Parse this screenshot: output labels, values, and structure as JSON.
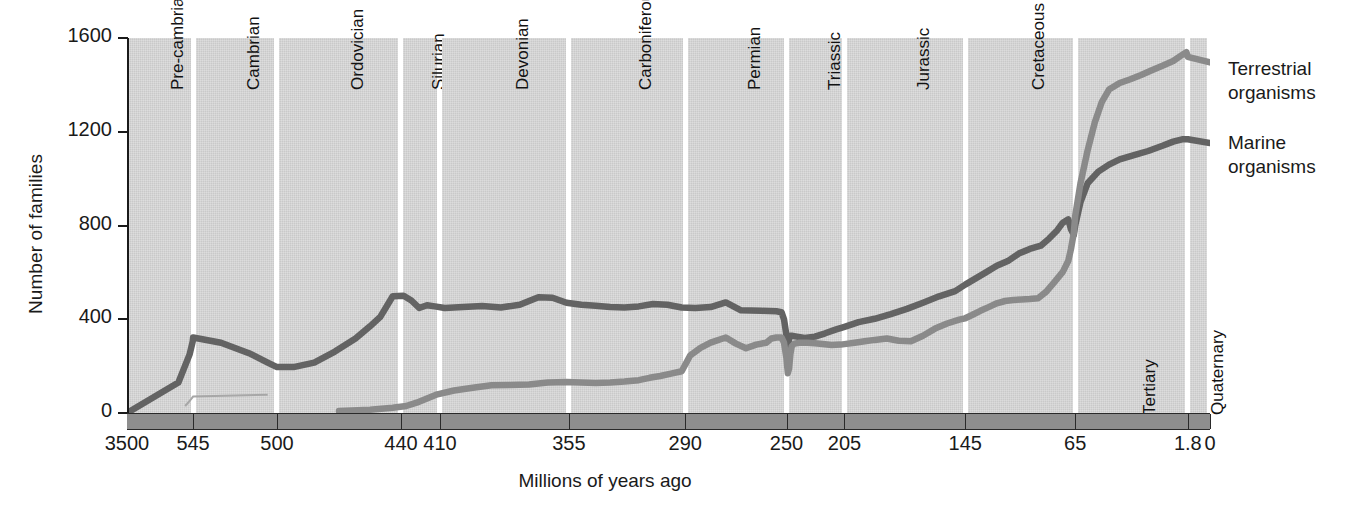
{
  "chart_data": {
    "type": "line",
    "title": "",
    "xlabel": "Millions of years ago",
    "ylabel": "Number of families",
    "ylim": [
      0,
      1600
    ],
    "yticks": [
      0,
      400,
      800,
      1200,
      1600
    ],
    "xticks": [
      "3500",
      "545",
      "500",
      "440",
      "410",
      "355",
      "290",
      "250",
      "205",
      "145",
      "65",
      "1.8",
      "0"
    ],
    "x_axis_direction": "reversed",
    "grid": false,
    "legend_position": "right",
    "background_band_color": "#c9c9c9",
    "periods": [
      {
        "name": "Pre-cambrian",
        "from": 3500,
        "to": 545
      },
      {
        "name": "Cambrian",
        "from": 545,
        "to": 500
      },
      {
        "name": "Ordovician",
        "from": 500,
        "to": 440
      },
      {
        "name": "Silurian",
        "from": 440,
        "to": 410
      },
      {
        "name": "Devonian",
        "from": 410,
        "to": 355
      },
      {
        "name": "Carboniferous",
        "from": 355,
        "to": 290
      },
      {
        "name": "Permian",
        "from": 290,
        "to": 250
      },
      {
        "name": "Triassic",
        "from": 250,
        "to": 205
      },
      {
        "name": "Jurassic",
        "from": 205,
        "to": 145
      },
      {
        "name": "Cretaceous",
        "from": 145,
        "to": 65
      },
      {
        "name": "Tertiary",
        "from": 65,
        "to": 1.8
      },
      {
        "name": "Quaternary",
        "from": 1.8,
        "to": 0
      }
    ],
    "series": [
      {
        "name": "Marine organisms",
        "color": "#636363",
        "label_line1": "Marine",
        "label_line2": "organisms",
        "points": [
          [
            3500,
            0
          ],
          [
            1200,
            130
          ],
          [
            700,
            250
          ],
          [
            560,
            305
          ],
          [
            545,
            322
          ],
          [
            530,
            300
          ],
          [
            515,
            255
          ],
          [
            505,
            215
          ],
          [
            500,
            196
          ],
          [
            492,
            196
          ],
          [
            482,
            215
          ],
          [
            472,
            262
          ],
          [
            462,
            318
          ],
          [
            455,
            370
          ],
          [
            450,
            410
          ],
          [
            444,
            498
          ],
          [
            438,
            500
          ],
          [
            432,
            480
          ],
          [
            426,
            448
          ],
          [
            420,
            460
          ],
          [
            414,
            455
          ],
          [
            408,
            448
          ],
          [
            400,
            452
          ],
          [
            392,
            456
          ],
          [
            384,
            450
          ],
          [
            376,
            462
          ],
          [
            368,
            494
          ],
          [
            362,
            492
          ],
          [
            356,
            470
          ],
          [
            348,
            462
          ],
          [
            340,
            458
          ],
          [
            332,
            452
          ],
          [
            324,
            450
          ],
          [
            316,
            455
          ],
          [
            308,
            465
          ],
          [
            300,
            462
          ],
          [
            292,
            450
          ],
          [
            286,
            448
          ],
          [
            280,
            452
          ],
          [
            274,
            472
          ],
          [
            268,
            438
          ],
          [
            260,
            436
          ],
          [
            254,
            434
          ],
          [
            252,
            430
          ],
          [
            251,
            400
          ],
          [
            250,
            330
          ],
          [
            249,
            278
          ],
          [
            248,
            318
          ],
          [
            247,
            330
          ],
          [
            246,
            330
          ],
          [
            242,
            326
          ],
          [
            236,
            320
          ],
          [
            228,
            326
          ],
          [
            220,
            340
          ],
          [
            212,
            356
          ],
          [
            205,
            368
          ],
          [
            198,
            388
          ],
          [
            190,
            402
          ],
          [
            182,
            422
          ],
          [
            174,
            444
          ],
          [
            166,
            470
          ],
          [
            158,
            498
          ],
          [
            150,
            520
          ],
          [
            145,
            548
          ],
          [
            138,
            572
          ],
          [
            130,
            600
          ],
          [
            122,
            628
          ],
          [
            114,
            648
          ],
          [
            106,
            680
          ],
          [
            98,
            700
          ],
          [
            90,
            714
          ],
          [
            84,
            744
          ],
          [
            78,
            780
          ],
          [
            74,
            812
          ],
          [
            70,
            826
          ],
          [
            68,
            784
          ],
          [
            66,
            760
          ],
          [
            65,
            800
          ],
          [
            62,
            900
          ],
          [
            58,
            980
          ],
          [
            52,
            1030
          ],
          [
            46,
            1060
          ],
          [
            40,
            1082
          ],
          [
            32,
            1100
          ],
          [
            24,
            1118
          ],
          [
            16,
            1140
          ],
          [
            10,
            1158
          ],
          [
            5,
            1168
          ],
          [
            1.8,
            1168
          ],
          [
            0,
            1152
          ]
        ]
      },
      {
        "name": "Terrestrial organisms",
        "color": "#8a8a8a",
        "label_line1": "Terrestrial",
        "label_line2": "organisms",
        "points": [
          [
            470,
            8
          ],
          [
            455,
            14
          ],
          [
            444,
            22
          ],
          [
            436,
            30
          ],
          [
            428,
            44
          ],
          [
            420,
            62
          ],
          [
            412,
            80
          ],
          [
            404,
            96
          ],
          [
            396,
            108
          ],
          [
            388,
            118
          ],
          [
            380,
            120
          ],
          [
            372,
            122
          ],
          [
            364,
            130
          ],
          [
            356,
            132
          ],
          [
            348,
            130
          ],
          [
            340,
            128
          ],
          [
            332,
            130
          ],
          [
            324,
            134
          ],
          [
            316,
            140
          ],
          [
            310,
            150
          ],
          [
            304,
            158
          ],
          [
            298,
            168
          ],
          [
            292,
            178
          ],
          [
            288,
            246
          ],
          [
            284,
            278
          ],
          [
            280,
            300
          ],
          [
            274,
            322
          ],
          [
            270,
            296
          ],
          [
            266,
            276
          ],
          [
            262,
            292
          ],
          [
            258,
            300
          ],
          [
            256,
            318
          ],
          [
            254,
            322
          ],
          [
            252,
            322
          ],
          [
            251,
            300
          ],
          [
            250,
            232
          ],
          [
            249,
            170
          ],
          [
            248,
            190
          ],
          [
            247,
            252
          ],
          [
            246,
            284
          ],
          [
            244,
            296
          ],
          [
            240,
            300
          ],
          [
            234,
            300
          ],
          [
            228,
            298
          ],
          [
            222,
            294
          ],
          [
            215,
            290
          ],
          [
            208,
            292
          ],
          [
            205,
            294
          ],
          [
            200,
            300
          ],
          [
            195,
            306
          ],
          [
            190,
            312
          ],
          [
            184,
            318
          ],
          [
            178,
            308
          ],
          [
            172,
            306
          ],
          [
            166,
            330
          ],
          [
            160,
            360
          ],
          [
            154,
            382
          ],
          [
            148,
            398
          ],
          [
            145,
            404
          ],
          [
            140,
            418
          ],
          [
            134,
            436
          ],
          [
            128,
            452
          ],
          [
            122,
            468
          ],
          [
            116,
            478
          ],
          [
            110,
            482
          ],
          [
            104,
            484
          ],
          [
            98,
            486
          ],
          [
            92,
            490
          ],
          [
            86,
            518
          ],
          [
            80,
            560
          ],
          [
            74,
            602
          ],
          [
            70,
            650
          ],
          [
            68,
            700
          ],
          [
            66,
            768
          ],
          [
            65,
            840
          ],
          [
            62,
            980
          ],
          [
            58,
            1120
          ],
          [
            54,
            1240
          ],
          [
            50,
            1328
          ],
          [
            46,
            1380
          ],
          [
            40,
            1408
          ],
          [
            34,
            1424
          ],
          [
            28,
            1442
          ],
          [
            22,
            1462
          ],
          [
            16,
            1482
          ],
          [
            10,
            1502
          ],
          [
            5,
            1528
          ],
          [
            2.6,
            1540
          ],
          [
            1.8,
            1520
          ],
          [
            0,
            1496
          ]
        ]
      }
    ]
  }
}
